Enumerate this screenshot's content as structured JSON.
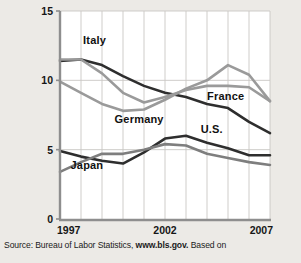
{
  "figure": {
    "source_prefix": "Source: Bureau of Labor Statistics, ",
    "source_link": "www.bls.gov.",
    "source_suffix": " Based on"
  },
  "chart_data": {
    "type": "line",
    "title": "",
    "xlabel": "",
    "ylabel": "Unemployment rate (percent)",
    "xlim": [
      1997,
      2007
    ],
    "ylim": [
      0,
      15
    ],
    "yticks": [
      0,
      5,
      10,
      15
    ],
    "ytick_labels": [
      "0",
      "5",
      "10",
      "15"
    ],
    "xticks": [
      1997,
      2002,
      2007
    ],
    "xtick_labels": [
      "1997",
      "2002",
      "2007"
    ],
    "grid": "vertical-and-horizontal",
    "grid_x_step": 1,
    "legend_position": "inline-annotations",
    "x": [
      1997,
      1998,
      1999,
      2000,
      2001,
      2002,
      2003,
      2004,
      2005,
      2006,
      2007
    ],
    "series": [
      {
        "name": "Italy",
        "color": "#2e2e2e",
        "label_x": 1998.1,
        "label_y": 12.6,
        "values": [
          11.4,
          11.5,
          11.1,
          10.3,
          9.6,
          9.1,
          8.8,
          8.3,
          8.0,
          7.0,
          6.2
        ]
      },
      {
        "name": "Germany",
        "color": "#9a9a9a",
        "label_x": 1999.6,
        "label_y": 6.9,
        "values": [
          9.9,
          9.1,
          8.3,
          7.8,
          7.9,
          8.6,
          9.4,
          10.0,
          11.1,
          10.4,
          8.5
        ]
      },
      {
        "name": "France",
        "color": "#9a9a9a",
        "label_x": 2004.0,
        "label_y": 8.6,
        "values": [
          11.5,
          11.5,
          10.5,
          9.1,
          8.4,
          8.8,
          9.3,
          9.6,
          9.6,
          9.5,
          8.5
        ]
      },
      {
        "name": "U.S.",
        "color": "#2e2e2e",
        "label_x": 2003.7,
        "label_y": 6.2,
        "values": [
          4.9,
          4.5,
          4.2,
          4.0,
          4.8,
          5.8,
          6.0,
          5.5,
          5.1,
          4.6,
          4.6
        ]
      },
      {
        "name": "Japan",
        "color": "#7e7e7e",
        "label_x": 1997.5,
        "label_y": 3.6,
        "values": [
          3.4,
          4.1,
          4.7,
          4.7,
          5.0,
          5.4,
          5.3,
          4.7,
          4.4,
          4.1,
          3.9
        ]
      }
    ]
  }
}
